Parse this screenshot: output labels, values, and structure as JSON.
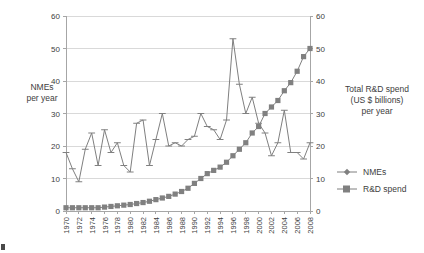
{
  "chart": {
    "type": "line",
    "left_axis_title_lines": [
      "NMEs",
      "per year"
    ],
    "right_axis_title_lines": [
      "Total R&D spend",
      "(US $ billions)",
      "per year"
    ],
    "y_ticks": [
      0,
      10,
      20,
      30,
      40,
      50,
      60
    ],
    "y2_ticks": [
      0,
      10,
      20,
      30,
      40,
      50,
      60
    ],
    "ylim": [
      0,
      60
    ],
    "y2lim": [
      0,
      60
    ],
    "xlim": [
      1970,
      2008
    ],
    "x_tick_labels": [
      "1970",
      "1972",
      "1974",
      "1976",
      "1978",
      "1980",
      "1982",
      "1984",
      "1986",
      "1988",
      "1990",
      "1992",
      "1994",
      "1996",
      "1998",
      "2000",
      "2002",
      "2004",
      "2006",
      "2008"
    ],
    "grid": "horizontal",
    "legend_position": "right",
    "colors": {
      "nmes": "#808080",
      "rd_spend": "#808080",
      "grid": "#d9d9d9",
      "axis": "#a6a6a6",
      "text": "#404040"
    },
    "legend": [
      {
        "label": "NMEs",
        "marker": "diamond"
      },
      {
        "label": "R&D spend",
        "marker": "square"
      }
    ]
  },
  "chart_data": {
    "type": "line",
    "title": "",
    "xlabel": "",
    "ylabel": "NMEs per year",
    "y2label": "Total R&D spend (US $ billions) per year",
    "ylim": [
      0,
      60
    ],
    "y2lim": [
      0,
      60
    ],
    "grid": true,
    "legend_position": "right",
    "x": [
      1970,
      1971,
      1972,
      1973,
      1974,
      1975,
      1976,
      1977,
      1978,
      1979,
      1980,
      1981,
      1982,
      1983,
      1984,
      1985,
      1986,
      1987,
      1988,
      1989,
      1990,
      1991,
      1992,
      1993,
      1994,
      1995,
      1996,
      1997,
      1998,
      1999,
      2000,
      2001,
      2002,
      2003,
      2004,
      2005,
      2006,
      2007,
      2008
    ],
    "series": [
      {
        "name": "NMEs",
        "axis": "left",
        "marker": "diamond",
        "color": "#808080",
        "values": [
          18,
          13,
          9,
          19,
          24,
          14,
          25,
          18,
          21,
          14,
          12,
          27,
          28,
          14,
          22,
          30,
          20,
          21,
          20,
          22,
          23,
          30,
          26,
          25,
          22,
          28,
          53,
          39,
          30,
          35,
          27,
          24,
          17,
          21,
          31,
          18,
          18,
          16,
          21
        ]
      },
      {
        "name": "R&D spend",
        "axis": "right",
        "marker": "square",
        "color": "#808080",
        "values": [
          1,
          1,
          1,
          1,
          1,
          1,
          1.2,
          1.4,
          1.6,
          1.8,
          2,
          2.3,
          2.6,
          3,
          3.5,
          4,
          4.5,
          5.2,
          6,
          7,
          8.5,
          10,
          11.5,
          12.5,
          13.5,
          15,
          17,
          19,
          21,
          24,
          26,
          30,
          32,
          34,
          37,
          39.5,
          43,
          47.5,
          50
        ]
      }
    ]
  }
}
